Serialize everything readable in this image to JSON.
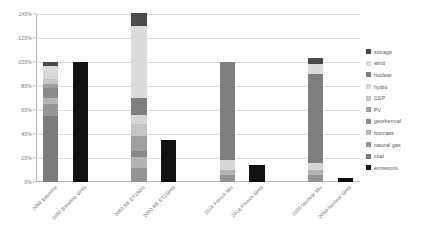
{
  "chart_data": {
    "type": "bar",
    "title": "",
    "xlabel": "",
    "ylabel": "",
    "ylim": [
      0,
      140
    ],
    "ytick_labels": [
      "0%",
      "20%",
      "40%",
      "60%",
      "80%",
      "100%",
      "120%",
      "140%"
    ],
    "ytick_values": [
      0,
      20,
      40,
      60,
      80,
      100,
      120,
      140
    ],
    "grid": true,
    "stacked": true,
    "legend_position": "right",
    "categories": [
      "2050 Baseline",
      "2050 Baseline GHG",
      "2050 RE ET180%",
      "2050 RE ET1GHG",
      "2018 French Mix",
      "2018 French GHG",
      "2050 Nuclear Mix",
      "2050 Nuclear GHG"
    ],
    "series": [
      {
        "name": "coal",
        "color": "#7b7b7b",
        "values": [
          55,
          0,
          0,
          0,
          0,
          0,
          0,
          0
        ]
      },
      {
        "name": "natural gas",
        "color": "#959595",
        "values": [
          10,
          0,
          12,
          0,
          6,
          0,
          6,
          0
        ]
      },
      {
        "name": "biomass",
        "color": "#b4b4b4",
        "values": [
          5,
          0,
          9,
          0,
          4,
          0,
          4,
          0
        ]
      },
      {
        "name": "geothermal",
        "color": "#8a8a8a",
        "values": [
          8,
          0,
          5,
          0,
          0,
          0,
          0,
          0
        ]
      },
      {
        "name": "PV",
        "color": "#9f9f9f",
        "values": [
          4,
          0,
          12,
          0,
          0,
          0,
          0,
          0
        ]
      },
      {
        "name": "CSP",
        "color": "#c6c6c6",
        "values": [
          4,
          0,
          10,
          0,
          0,
          0,
          0,
          0
        ]
      },
      {
        "name": "hydro",
        "color": "#d6d6d6",
        "values": [
          6,
          0,
          8,
          0,
          8,
          0,
          6,
          0
        ]
      },
      {
        "name": "nuclear",
        "color": "#7f7f7f",
        "values": [
          0,
          0,
          14,
          0,
          82,
          0,
          74,
          0
        ]
      },
      {
        "name": "wind",
        "color": "#dcdcdc",
        "values": [
          5,
          0,
          60,
          0,
          0,
          0,
          8,
          0
        ]
      },
      {
        "name": "storage",
        "color": "#4a4a4a",
        "values": [
          3,
          0,
          11,
          0,
          0,
          0,
          5,
          0
        ]
      },
      {
        "name": "emissions",
        "color": "#111111",
        "values": [
          0,
          100,
          0,
          35,
          0,
          14,
          0,
          3
        ]
      }
    ],
    "bar_totals": [
      100,
      100,
      141,
      35,
      100,
      14,
      103,
      3
    ],
    "legend_entries": [
      "storage",
      "wind",
      "nuclear",
      "hydro",
      "CSP",
      "PV",
      "geothermal",
      "biomass",
      "natural gas",
      "coal",
      "emissions"
    ],
    "legend_colors": [
      "#4a4a4a",
      "#dcdcdc",
      "#7f7f7f",
      "#d6d6d6",
      "#c6c6c6",
      "#9f9f9f",
      "#8a8a8a",
      "#b4b4b4",
      "#959595",
      "#7b7b7b",
      "#111111"
    ],
    "bar_group_positions": [
      0,
      1,
      3,
      4,
      6,
      7,
      9,
      10
    ],
    "slot_count": 11
  }
}
